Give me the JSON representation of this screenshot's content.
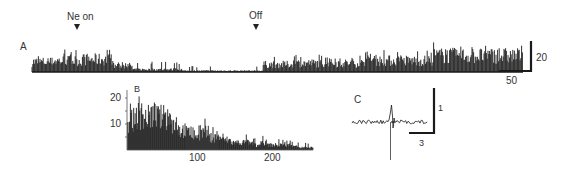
{
  "chart_data": [
    {
      "panel": "A",
      "type": "bar",
      "title": "",
      "annotations": [
        {
          "label": "Ne on",
          "marker": "down-arrow",
          "x_px": 77
        },
        {
          "label": "Off",
          "marker": "down-arrow",
          "x_px": 256
        }
      ],
      "scale_bars": {
        "vertical": "20",
        "horizontal": "50"
      },
      "description": "Spike-count histogram over time: high activity before and during Ne on, drop to low activity after ~x=150, low until Off, then increasing activity reaching maximum near the end.",
      "segments": [
        {
          "x_start": 0,
          "x_end": 20,
          "mean_height": 8,
          "peak": 14
        },
        {
          "x_start": 20,
          "x_end": 50,
          "mean_height": 9,
          "peak": 18
        },
        {
          "x_start": 50,
          "x_end": 80,
          "mean_height": 10,
          "peak": 19
        },
        {
          "x_start": 80,
          "x_end": 100,
          "mean_height": 5,
          "peak": 10
        },
        {
          "x_start": 100,
          "x_end": 150,
          "mean_height": 2,
          "peak": 9
        },
        {
          "x_start": 150,
          "x_end": 230,
          "mean_height": 1,
          "peak": 5
        },
        {
          "x_start": 230,
          "x_end": 260,
          "mean_height": 6,
          "peak": 16
        },
        {
          "x_start": 260,
          "x_end": 330,
          "mean_height": 7,
          "peak": 14
        },
        {
          "x_start": 330,
          "x_end": 400,
          "mean_height": 9,
          "peak": 18
        },
        {
          "x_start": 400,
          "x_end": 450,
          "mean_height": 13,
          "peak": 24
        },
        {
          "x_start": 450,
          "x_end": 490,
          "mean_height": 13,
          "peak": 22
        }
      ]
    },
    {
      "panel": "B",
      "type": "bar",
      "title": "",
      "xlabel": "",
      "ylabel": "",
      "x_ticks": [
        "100",
        "200"
      ],
      "y_ticks": [
        "10",
        "20"
      ],
      "ylim": [
        0,
        25
      ],
      "xlim": [
        0,
        250
      ],
      "description": "Interval histogram decaying with x",
      "x": [
        5,
        15,
        25,
        35,
        45,
        55,
        65,
        75,
        85,
        95,
        105,
        115,
        125,
        135,
        145,
        155,
        165,
        175,
        185,
        195,
        205,
        215,
        225,
        235,
        245
      ],
      "values": [
        12,
        14,
        13,
        14,
        13,
        13,
        11,
        8,
        7,
        6,
        7,
        5,
        5,
        4,
        3,
        3,
        3,
        2,
        3,
        2,
        2,
        2,
        2,
        1,
        1
      ],
      "peaks": [
        18,
        22,
        17,
        19,
        17,
        16,
        15,
        12,
        11,
        10,
        13,
        10,
        9,
        8,
        6,
        6,
        6,
        5,
        6,
        5,
        5,
        4,
        4,
        3,
        3
      ]
    },
    {
      "panel": "C",
      "type": "line",
      "description": "Extracellular spike waveform: noisy baseline with biphasic spike",
      "scale_bars": {
        "vertical": "1",
        "horizontal": "3"
      }
    }
  ],
  "labels": {
    "panel_a": "A",
    "panel_b": "B",
    "panel_c": "C",
    "ne_on": "Ne on",
    "off": "Off",
    "scale_a_v": "20",
    "scale_a_h": "50",
    "b_tick_y20": "20",
    "b_tick_y10": "10",
    "b_tick_x100": "100",
    "b_tick_x200": "200",
    "scale_c_v": "1",
    "scale_c_h": "3"
  },
  "colors": {
    "ink": "#1a1a1a",
    "bg": "#ffffff"
  }
}
